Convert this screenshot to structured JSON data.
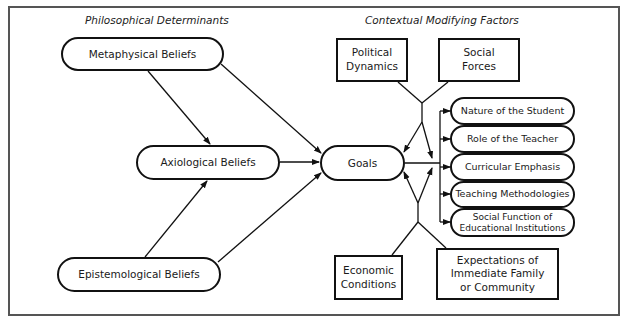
{
  "sections": {
    "philosophical": "Philosophical Determinants",
    "contextual": "Contextual Modifying Factors"
  },
  "beliefs": {
    "metaphysical": "Metaphysical Beliefs",
    "axiological": "Axiological Beliefs",
    "epistemological": "Epistemological Beliefs"
  },
  "center": {
    "goals": "Goals"
  },
  "factors": {
    "political": "Political\nDynamics",
    "social": "Social\nForces",
    "economic": "Economic\nConditions",
    "expectations": "Expectations of\nImmediate Family\nor Community"
  },
  "outcomes": [
    "Nature of the Student",
    "Role of the Teacher",
    "Curricular Emphasis",
    "Teaching Methodologies",
    "Social Function of\nEducational Institutions"
  ],
  "colors": {
    "line": "#111111",
    "frame": "#555555",
    "background": "#ffffff"
  }
}
